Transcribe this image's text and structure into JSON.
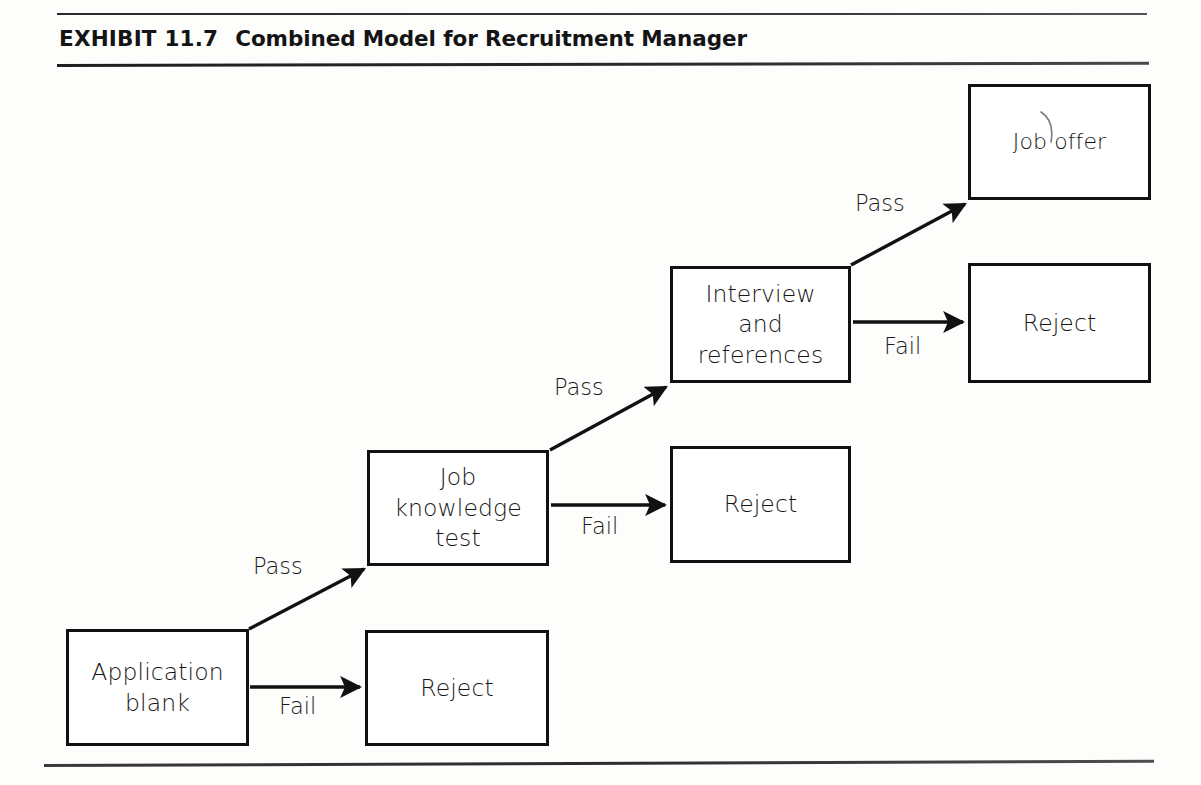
{
  "exhibit": {
    "label": "EXHIBIT 11.7",
    "title": "Combined Model for Recruitment Manager",
    "full_title": "EXHIBIT 11.7   Combined Model for Recruitment Manager"
  },
  "diagram": {
    "type": "flowchart",
    "orientation": "bottom-left to top-right stepped selection funnel",
    "nodes": [
      {
        "id": "application",
        "label": "Application\nblank",
        "line1": "Application",
        "line2": "blank"
      },
      {
        "id": "reject-1",
        "label": "Reject"
      },
      {
        "id": "jobtest",
        "label": "Job\nknowledge\ntest",
        "line1": "Job",
        "line2": "knowledge",
        "line3": "test"
      },
      {
        "id": "reject-2",
        "label": "Reject"
      },
      {
        "id": "interview",
        "label": "Interview\nand\nreferences",
        "line1": "Interview",
        "line2": "and",
        "line3": "references"
      },
      {
        "id": "reject-3",
        "label": "Reject"
      },
      {
        "id": "joboffer",
        "label": "Job offer"
      }
    ],
    "edges": [
      {
        "from": "application",
        "to": "reject-1",
        "label": "Fail",
        "direction": "horizontal"
      },
      {
        "from": "application",
        "to": "jobtest",
        "label": "Pass",
        "direction": "diagonal-up"
      },
      {
        "from": "jobtest",
        "to": "reject-2",
        "label": "Fail",
        "direction": "horizontal"
      },
      {
        "from": "jobtest",
        "to": "interview",
        "label": "Pass",
        "direction": "diagonal-up"
      },
      {
        "from": "interview",
        "to": "reject-3",
        "label": "Fail",
        "direction": "horizontal"
      },
      {
        "from": "interview",
        "to": "joboffer",
        "label": "Pass",
        "direction": "diagonal-up"
      }
    ]
  },
  "colors": {
    "page_background": "#fdfdfc",
    "ink": "#111111",
    "rule": "#2b2b2b"
  }
}
